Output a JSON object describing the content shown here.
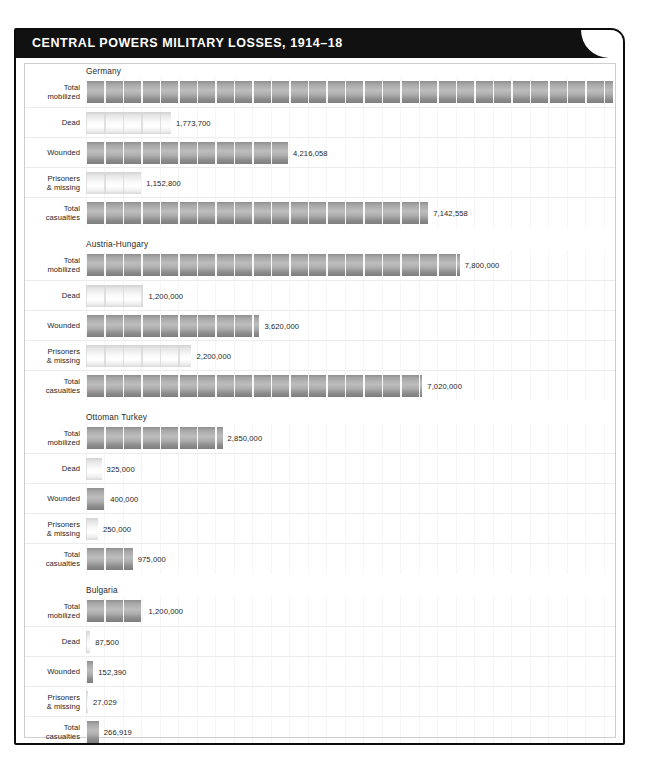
{
  "header": {
    "title": "CENTRAL POWERS MILITARY LOSSES, 1914–18"
  },
  "chart_data": {
    "type": "bar",
    "title": "CENTRAL POWERS MILITARY LOSSES, 1914–18",
    "xlabel": "",
    "ylabel": "",
    "orientation": "horizontal",
    "grid": true,
    "legend": "none",
    "xlim": [
      0,
      11000000
    ],
    "categories": [
      "Total mobilized",
      "Dead",
      "Wounded",
      "Prisoners & missing",
      "Total casualties"
    ],
    "groups": [
      {
        "name": "Germany",
        "rows": [
          {
            "label_line1": "Total",
            "label_line2": "mobilized",
            "value": 11000000,
            "value_label": "11,000,000",
            "shade": "dark"
          },
          {
            "label_line1": "Dead",
            "label_line2": "",
            "value": 1773700,
            "value_label": "1,773,700",
            "shade": "light"
          },
          {
            "label_line1": "Wounded",
            "label_line2": "",
            "value": 4216058,
            "value_label": "4,216,058",
            "shade": "dark"
          },
          {
            "label_line1": "Prisoners",
            "label_line2": "& missing",
            "value": 1152800,
            "value_label": "1,152,800",
            "shade": "light"
          },
          {
            "label_line1": "Total",
            "label_line2": "casualties",
            "value": 7142558,
            "value_label": "7,142,558",
            "shade": "dark"
          }
        ]
      },
      {
        "name": "Austria-Hungary",
        "rows": [
          {
            "label_line1": "Total",
            "label_line2": "mobilized",
            "value": 7800000,
            "value_label": "7,800,000",
            "shade": "dark"
          },
          {
            "label_line1": "Dead",
            "label_line2": "",
            "value": 1200000,
            "value_label": "1,200,000",
            "shade": "light"
          },
          {
            "label_line1": "Wounded",
            "label_line2": "",
            "value": 3620000,
            "value_label": "3,620,000",
            "shade": "dark"
          },
          {
            "label_line1": "Prisoners",
            "label_line2": "& missing",
            "value": 2200000,
            "value_label": "2,200,000",
            "shade": "light"
          },
          {
            "label_line1": "Total",
            "label_line2": "casualties",
            "value": 7020000,
            "value_label": "7,020,000",
            "shade": "dark"
          }
        ]
      },
      {
        "name": "Ottoman Turkey",
        "rows": [
          {
            "label_line1": "Total",
            "label_line2": "mobilized",
            "value": 2850000,
            "value_label": "2,850,000",
            "shade": "dark"
          },
          {
            "label_line1": "Dead",
            "label_line2": "",
            "value": 325000,
            "value_label": "325,000",
            "shade": "light"
          },
          {
            "label_line1": "Wounded",
            "label_line2": "",
            "value": 400000,
            "value_label": "400,000",
            "shade": "dark"
          },
          {
            "label_line1": "Prisoners",
            "label_line2": "& missing",
            "value": 250000,
            "value_label": "250,000",
            "shade": "light"
          },
          {
            "label_line1": "Total",
            "label_line2": "casualties",
            "value": 975000,
            "value_label": "975,000",
            "shade": "dark"
          }
        ]
      },
      {
        "name": "Bulgaria",
        "rows": [
          {
            "label_line1": "Total",
            "label_line2": "mobilized",
            "value": 1200000,
            "value_label": "1,200,000",
            "shade": "dark"
          },
          {
            "label_line1": "Dead",
            "label_line2": "",
            "value": 87500,
            "value_label": "87,500",
            "shade": "light"
          },
          {
            "label_line1": "Wounded",
            "label_line2": "",
            "value": 152390,
            "value_label": "152,390",
            "shade": "dark"
          },
          {
            "label_line1": "Prisoners",
            "label_line2": "& missing",
            "value": 27029,
            "value_label": "27,029",
            "shade": "light"
          },
          {
            "label_line1": "Total",
            "label_line2": "casualties",
            "value": 266919,
            "value_label": "266,919",
            "shade": "dark"
          }
        ]
      }
    ]
  },
  "colors": {
    "frame": "#0c0c0c",
    "titlebar_bg": "#111111",
    "titlebar_text": "#ffffff",
    "bar_dark": "#a8a8a8",
    "bar_light": "#f0f0f0",
    "gridline": "#ececec",
    "panel_bg": "#ffffff"
  }
}
